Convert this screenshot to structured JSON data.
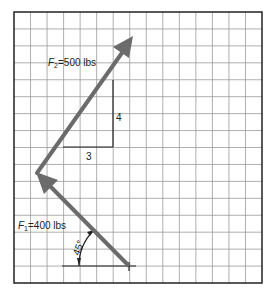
{
  "diagram": {
    "type": "vector-force-diagram",
    "grid": {
      "columns": 15,
      "rows": 16,
      "color": "#9a9a9a",
      "border_color": "#222222"
    },
    "arrow_color": "#6b6b6b",
    "forces": [
      {
        "id": "F1",
        "symbol": "F",
        "subscript": "1",
        "value_text": "=400 lbs",
        "label": "F1=400 lbs",
        "angle_label": "45°"
      },
      {
        "id": "F2",
        "symbol": "F",
        "subscript": "2",
        "value_text": "=500 lbs",
        "label": "F2=500 lbs",
        "slope_rise": "4",
        "slope_run": "3"
      }
    ]
  }
}
